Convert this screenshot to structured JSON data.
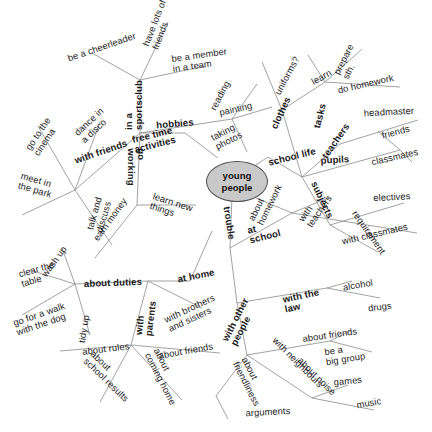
{
  "diagram": {
    "center": {
      "line1": "young",
      "line2": "people",
      "fill": "#c9c9c9",
      "stroke": "#4d4d4d"
    },
    "line_color": "#8a8a8a",
    "text_color": "#1a1a1a",
    "background": "#ffffff"
  },
  "nodes": {
    "free_time_activities": "free time\nactivities",
    "in_a_sportsclub": "in a\nsportsclub",
    "be_a_cheerleader": "be a cheerleader",
    "have_lots_of_friends": "have lots of\nfriends",
    "be_a_member_in_a_team": "be a member\nin a team",
    "with_friends": "with friends",
    "go_to_the_cinema": "go to the\ncinema",
    "dance_in_a_disco": "dance in\na disco",
    "meet_in_the_park": "meet in\nthe park",
    "talk_and_discuss": "talk and\ndiscuss",
    "hobbies": "hobbies",
    "reading": "reading",
    "painting": "painting",
    "taking_photos": "taking\nphotos",
    "go_working": "go\nworking",
    "earn_money": "earn money",
    "learn_new_things": "learn new\nthings",
    "school_life": "school life",
    "clothes": "clothes",
    "uniforms": "uniforms?",
    "tasks": "tasks",
    "learn": "learn",
    "prepare_sth": "prepare\nsth.",
    "do_homework": "do homework",
    "teachers": "teachers",
    "headmaster": "headmaster",
    "pupils": "pupils",
    "friends": "friends",
    "classmates": "classmates",
    "subjects": "subjects",
    "electives": "electives",
    "requirement": "requirement",
    "trouble": "trouble",
    "at_school": "at\nschool",
    "about_homework": "about\nhomework",
    "with_teachers": "with\nteachers",
    "with_classmates": "with classmates",
    "with_the_law": "with the\nlaw",
    "alcohol": "alcohol",
    "drugs": "drugs",
    "with_other_people": "with other\npeople",
    "about_friends_trouble": "about friends",
    "be_a_big_group": "be a\nbig group",
    "with_neighbours": "with neighbours",
    "about_noise": "about noise",
    "games": "games",
    "music": "music",
    "about_friendliness": "about\nfriendliness",
    "arguments": "arguments",
    "at_home": "at home",
    "about_duties": "about duties",
    "wash_up": "wash up",
    "clear_the_table": "clear the\ntable",
    "go_for_a_walk_with_the_dog": "go for a walk\nwith the dog",
    "tidy_up": "tidy up",
    "with_parents": "with\nparents",
    "about_rules": "about rules",
    "about_school_results": "about\nschool results",
    "about_coming_home": "about\ncoming home",
    "about_friends_parents": "about friends",
    "with_brothers_and_sisters": "with brothers\nand sisters"
  },
  "edges": [
    [
      218,
      158,
      185,
      133
    ],
    [
      185,
      133,
      140,
      133
    ],
    [
      140,
      133,
      140,
      80
    ],
    [
      140,
      80,
      92,
      53
    ],
    [
      140,
      80,
      168,
      22
    ],
    [
      140,
      80,
      205,
      66
    ],
    [
      140,
      133,
      75,
      190
    ],
    [
      75,
      190,
      38,
      126
    ],
    [
      75,
      190,
      100,
      122
    ],
    [
      75,
      190,
      22,
      215
    ],
    [
      75,
      190,
      112,
      245
    ],
    [
      140,
      133,
      232,
      119
    ],
    [
      232,
      119,
      257,
      84
    ],
    [
      232,
      119,
      272,
      107
    ],
    [
      232,
      119,
      247,
      152
    ],
    [
      140,
      133,
      137,
      205
    ],
    [
      137,
      205,
      95,
      258
    ],
    [
      137,
      205,
      196,
      205
    ],
    [
      229,
      183,
      268,
      157
    ],
    [
      268,
      157,
      302,
      177
    ],
    [
      302,
      177,
      282,
      110
    ],
    [
      282,
      110,
      262,
      62
    ],
    [
      282,
      110,
      325,
      82
    ],
    [
      325,
      82,
      308,
      55
    ],
    [
      325,
      82,
      362,
      49
    ],
    [
      325,
      82,
      400,
      87
    ],
    [
      302,
      177,
      340,
      144
    ],
    [
      340,
      144,
      418,
      120
    ],
    [
      302,
      177,
      400,
      150
    ],
    [
      400,
      150,
      378,
      131
    ],
    [
      400,
      150,
      412,
      162
    ],
    [
      302,
      177,
      330,
      225
    ],
    [
      330,
      225,
      404,
      203
    ],
    [
      330,
      225,
      378,
      252
    ],
    [
      232,
      196,
      230,
      248
    ],
    [
      230,
      248,
      292,
      213
    ],
    [
      292,
      213,
      256,
      198
    ],
    [
      292,
      213,
      330,
      197
    ],
    [
      292,
      213,
      417,
      233
    ],
    [
      230,
      248,
      237,
      303
    ],
    [
      237,
      303,
      327,
      288
    ],
    [
      327,
      288,
      352,
      281
    ],
    [
      327,
      288,
      380,
      298
    ],
    [
      237,
      303,
      247,
      355
    ],
    [
      247,
      355,
      330,
      341
    ],
    [
      330,
      341,
      350,
      331
    ],
    [
      330,
      341,
      372,
      352
    ],
    [
      247,
      355,
      312,
      398
    ],
    [
      312,
      398,
      348,
      385
    ],
    [
      312,
      398,
      374,
      410
    ],
    [
      247,
      355,
      216,
      396
    ],
    [
      216,
      396,
      228,
      419
    ],
    [
      212,
      231,
      190,
      281
    ],
    [
      190,
      281,
      148,
      281
    ],
    [
      148,
      281,
      75,
      284
    ],
    [
      75,
      284,
      62,
      248
    ],
    [
      75,
      284,
      30,
      270
    ],
    [
      75,
      284,
      22,
      315
    ],
    [
      75,
      284,
      90,
      335
    ],
    [
      148,
      281,
      202,
      308
    ],
    [
      148,
      281,
      131,
      345
    ],
    [
      131,
      345,
      60,
      351
    ],
    [
      131,
      345,
      100,
      402
    ],
    [
      131,
      345,
      182,
      400
    ],
    [
      131,
      345,
      220,
      353
    ]
  ],
  "labels": [
    {
      "name": "free-time-activities",
      "key": "free_time_activities",
      "x": 154,
      "y": 140,
      "rot": -14,
      "bold": true
    },
    {
      "name": "in-a-sportsclub",
      "key": "in_a_sportsclub",
      "x": 134,
      "y": 105,
      "rot": -90,
      "bold": true
    },
    {
      "name": "be-a-cheerleader",
      "key": "be_a_cheerleader",
      "x": 102,
      "y": 48,
      "rot": -19,
      "bold": false
    },
    {
      "name": "have-lots-of-friends",
      "key": "have_lots_of_friends",
      "x": 160,
      "y": 25,
      "rot": -69,
      "bold": false
    },
    {
      "name": "be-a-member-in-a-team",
      "key": "be_a_member_in_a_team",
      "x": 200,
      "y": 61,
      "rot": -8,
      "bold": false
    },
    {
      "name": "with-friends",
      "key": "with_friends",
      "x": 101,
      "y": 152,
      "rot": -19,
      "bold": true
    },
    {
      "name": "go-to-the-cinema",
      "key": "go_to_the_cinema",
      "x": 43,
      "y": 137,
      "rot": -56,
      "bold": false
    },
    {
      "name": "dance-in-a-disco",
      "key": "dance_in_a_disco",
      "x": 93,
      "y": 126,
      "rot": -43,
      "bold": false
    },
    {
      "name": "meet-in-the-park",
      "key": "meet_in_the_park",
      "x": 36,
      "y": 186,
      "rot": 16,
      "bold": false
    },
    {
      "name": "talk-and-discuss",
      "key": "talk_and_discuss",
      "x": 100,
      "y": 215,
      "rot": -74,
      "bold": false
    },
    {
      "name": "hobbies",
      "key": "hobbies",
      "x": 175,
      "y": 124,
      "rot": -5,
      "bold": true
    },
    {
      "name": "reading",
      "key": "reading",
      "x": 221,
      "y": 96,
      "rot": -62,
      "bold": false
    },
    {
      "name": "painting",
      "key": "painting",
      "x": 236,
      "y": 110,
      "rot": -13,
      "bold": false
    },
    {
      "name": "taking-photos",
      "key": "taking_photos",
      "x": 227,
      "y": 137,
      "rot": -27,
      "bold": false
    },
    {
      "name": "go-working",
      "key": "go_working",
      "x": 136,
      "y": 167,
      "rot": 90,
      "bold": true
    },
    {
      "name": "earn-money",
      "key": "earn_money",
      "x": 111,
      "y": 220,
      "rot": -54,
      "bold": false
    },
    {
      "name": "learn-new-things",
      "key": "learn_new_things",
      "x": 171,
      "y": 208,
      "rot": 18,
      "bold": false
    },
    {
      "name": "school-life",
      "key": "school_life",
      "x": 292,
      "y": 157,
      "rot": -14,
      "bold": true
    },
    {
      "name": "clothes",
      "key": "clothes",
      "x": 281,
      "y": 113,
      "rot": -65,
      "bold": true
    },
    {
      "name": "uniforms",
      "key": "uniforms",
      "x": 288,
      "y": 76,
      "rot": -62,
      "bold": false
    },
    {
      "name": "tasks",
      "key": "tasks",
      "x": 320,
      "y": 116,
      "rot": -76,
      "bold": true
    },
    {
      "name": "learn",
      "key": "learn",
      "x": 322,
      "y": 78,
      "rot": -30,
      "bold": false
    },
    {
      "name": "prepare-sth",
      "key": "prepare_sth",
      "x": 349,
      "y": 62,
      "rot": -63,
      "bold": false
    },
    {
      "name": "do-homework",
      "key": "do_homework",
      "x": 366,
      "y": 85,
      "rot": -13,
      "bold": false
    },
    {
      "name": "teachers",
      "key": "teachers",
      "x": 336,
      "y": 141,
      "rot": -55,
      "bold": true
    },
    {
      "name": "headmaster",
      "key": "headmaster",
      "x": 389,
      "y": 113,
      "rot": -3,
      "bold": false
    },
    {
      "name": "pupils",
      "key": "pupils",
      "x": 335,
      "y": 160,
      "rot": -3,
      "bold": true
    },
    {
      "name": "friends",
      "key": "friends",
      "x": 396,
      "y": 133,
      "rot": -15,
      "bold": false
    },
    {
      "name": "classmates",
      "key": "classmates",
      "x": 395,
      "y": 158,
      "rot": -13,
      "bold": false
    },
    {
      "name": "subjects",
      "key": "subjects",
      "x": 322,
      "y": 200,
      "rot": 65,
      "bold": true
    },
    {
      "name": "electives",
      "key": "electives",
      "x": 392,
      "y": 198,
      "rot": -3,
      "bold": false
    },
    {
      "name": "requirement",
      "key": "requirement",
      "x": 368,
      "y": 233,
      "rot": 55,
      "bold": false
    },
    {
      "name": "trouble",
      "key": "trouble",
      "x": 229,
      "y": 223,
      "rot": 81,
      "bold": true
    },
    {
      "name": "at-school",
      "key": "at_school",
      "x": 264,
      "y": 232,
      "rot": -14,
      "bold": true
    },
    {
      "name": "about-homework",
      "key": "about_homework",
      "x": 266,
      "y": 203,
      "rot": -64,
      "bold": false
    },
    {
      "name": "with-teachers",
      "key": "with_teachers",
      "x": 316,
      "y": 209,
      "rot": -55,
      "bold": false
    },
    {
      "name": "with-classmates",
      "key": "with_classmates",
      "x": 375,
      "y": 235,
      "rot": -13,
      "bold": false
    },
    {
      "name": "with-the-law",
      "key": "with_the_law",
      "x": 302,
      "y": 301,
      "rot": -12,
      "bold": true
    },
    {
      "name": "alcohol",
      "key": "alcohol",
      "x": 358,
      "y": 286,
      "rot": -10,
      "bold": false
    },
    {
      "name": "drugs",
      "key": "drugs",
      "x": 380,
      "y": 308,
      "rot": -7,
      "bold": false
    },
    {
      "name": "with-other-people",
      "key": "with_other_people",
      "x": 240,
      "y": 322,
      "rot": -63,
      "bold": true
    },
    {
      "name": "about-friends-trouble",
      "key": "about_friends_trouble",
      "x": 330,
      "y": 336,
      "rot": -8,
      "bold": false
    },
    {
      "name": "be-a-big-group",
      "key": "be_a_big_group",
      "x": 345,
      "y": 355,
      "rot": -9,
      "bold": false
    },
    {
      "name": "with-neighbours",
      "key": "with_neighbours",
      "x": 297,
      "y": 363,
      "rot": 45,
      "bold": false
    },
    {
      "name": "about-noise",
      "key": "about_noise",
      "x": 316,
      "y": 377,
      "rot": 45,
      "bold": false
    },
    {
      "name": "games",
      "key": "games",
      "x": 348,
      "y": 382,
      "rot": -6,
      "bold": false
    },
    {
      "name": "music",
      "key": "music",
      "x": 369,
      "y": 404,
      "rot": -10,
      "bold": false
    },
    {
      "name": "about-friendliness",
      "key": "about_friendliness",
      "x": 250,
      "y": 382,
      "rot": 63,
      "bold": false
    },
    {
      "name": "arguments",
      "key": "arguments",
      "x": 268,
      "y": 413,
      "rot": -3,
      "bold": false
    },
    {
      "name": "at-home",
      "key": "at_home",
      "x": 196,
      "y": 276,
      "rot": -11,
      "bold": true
    },
    {
      "name": "about-duties",
      "key": "about_duties",
      "x": 113,
      "y": 283,
      "rot": -2,
      "bold": true
    },
    {
      "name": "wash-up",
      "key": "wash_up",
      "x": 55,
      "y": 262,
      "rot": -54,
      "bold": false
    },
    {
      "name": "clear-the-table",
      "key": "clear_the_table",
      "x": 38,
      "y": 275,
      "rot": -16,
      "bold": false
    },
    {
      "name": "go-for-a-walk-with-the-dog",
      "key": "go_for_a_walk_with_the_dog",
      "x": 41,
      "y": 320,
      "rot": -19,
      "bold": false
    },
    {
      "name": "tidy-up",
      "key": "tidy_up",
      "x": 85,
      "y": 329,
      "rot": -81,
      "bold": false
    },
    {
      "name": "with-parents",
      "key": "with_parents",
      "x": 146,
      "y": 318,
      "rot": -83,
      "bold": true
    },
    {
      "name": "about-rules",
      "key": "about_rules",
      "x": 106,
      "y": 350,
      "rot": -7,
      "bold": false
    },
    {
      "name": "about-school-results",
      "key": "about_school_results",
      "x": 109,
      "y": 377,
      "rot": 44,
      "bold": false
    },
    {
      "name": "about-coming-home",
      "key": "about_coming_home",
      "x": 164,
      "y": 377,
      "rot": 63,
      "bold": false
    },
    {
      "name": "about-friends-parents",
      "key": "about_friends_parents",
      "x": 186,
      "y": 352,
      "rot": -10,
      "bold": false
    },
    {
      "name": "with-brothers-and-sisters",
      "key": "with_brothers_and_sisters",
      "x": 192,
      "y": 314,
      "rot": -25,
      "bold": false
    }
  ]
}
